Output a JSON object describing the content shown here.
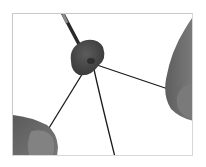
{
  "image": {
    "description": "Photo of two hands holding black cords threaded through a dark gray oval bead, with a needle tip entering from the top",
    "palette": {
      "background": "#ffffff",
      "frame": "#c8c8c8",
      "skin": "#6e6e6e",
      "skin_light": "#8a8a8a",
      "bead": "#4a4a4a",
      "cord": "#1a1a1a",
      "needle": "#2a2a2a"
    }
  }
}
